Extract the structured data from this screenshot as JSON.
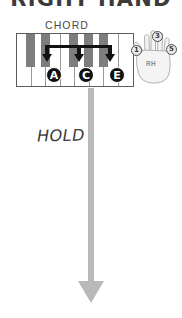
{
  "title": "RIGHT HAND",
  "chord": {
    "label": "CHORD"
  },
  "keyboard": {
    "white_keys": 8,
    "black_keys": 5,
    "notes": [
      {
        "letter": "A",
        "x": 46
      },
      {
        "letter": "C",
        "x": 78
      },
      {
        "letter": "E",
        "x": 110
      }
    ]
  },
  "hand": {
    "label": "RH",
    "fingers": [
      {
        "number": "1",
        "name": "thumb"
      },
      {
        "number": "3",
        "name": "middle"
      },
      {
        "number": "5",
        "name": "pinky"
      }
    ]
  },
  "hold": {
    "label": "HOLD"
  },
  "colors": {
    "black_key": "#7d7d7d",
    "note_circle": "#111111",
    "hold_arrow": "#b9b9b9",
    "text": "#3b3b3b",
    "keyboard_border": "#5d5d5d"
  }
}
